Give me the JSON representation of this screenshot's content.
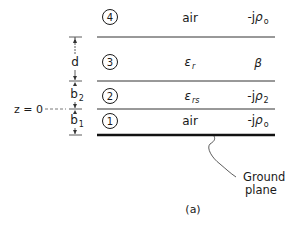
{
  "figure": {
    "caption": "(a)",
    "layers": [
      {
        "id": "4",
        "number": "4",
        "medium": "air",
        "medium_sub": "",
        "constant": "-j",
        "constant_symbol": "ρ",
        "constant_sub": "o"
      },
      {
        "id": "3",
        "number": "3",
        "medium": "ε",
        "medium_sub": "r",
        "constant": "",
        "constant_symbol": "β",
        "constant_sub": ""
      },
      {
        "id": "2",
        "number": "2",
        "medium": "ε",
        "medium_sub": "rs",
        "constant": "-j",
        "constant_symbol": "ρ",
        "constant_sub": "2"
      },
      {
        "id": "1",
        "number": "1",
        "medium": "air",
        "medium_sub": "",
        "constant": "-j",
        "constant_symbol": "ρ",
        "constant_sub": "o"
      }
    ],
    "dimensions": [
      {
        "label": "d",
        "sub": ""
      },
      {
        "label": "b",
        "sub": "2"
      },
      {
        "label": "b",
        "sub": "1"
      }
    ],
    "origin_label": "z = 0",
    "ground_label_line1": "Ground",
    "ground_label_line2": "plane"
  }
}
